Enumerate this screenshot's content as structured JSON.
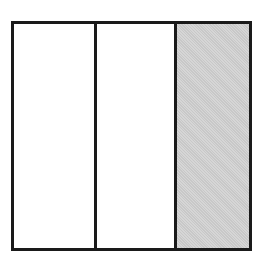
{
  "diagram": {
    "type": "fraction-model",
    "total_parts": 3,
    "shaded_parts": 1,
    "parts": [
      {
        "index": 1,
        "shaded": false
      },
      {
        "index": 2,
        "shaded": false
      },
      {
        "index": 3,
        "shaded": true
      }
    ],
    "colors": {
      "border": "#1a1a1a",
      "shaded": "#c8c8c8",
      "unshaded": "#ffffff"
    }
  }
}
